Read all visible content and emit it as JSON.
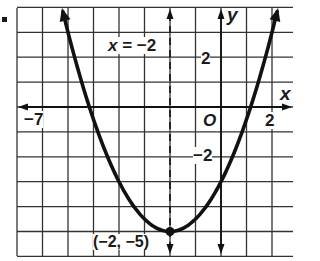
{
  "chart_data": {
    "type": "line",
    "title": "",
    "function": "y = 0.5(x + 2)^2 - 5",
    "xlabel": "x",
    "ylabel": "y",
    "xlim": [
      -8,
      2.8
    ],
    "ylim": [
      -5.8,
      4
    ],
    "grid": true,
    "grid_step": 1,
    "x_tick_labels": [
      {
        "value": -7,
        "label": "−7"
      },
      {
        "value": 2,
        "label": "2"
      }
    ],
    "y_tick_labels": [
      {
        "value": 2,
        "label": "2"
      },
      {
        "value": -2,
        "label": "−2"
      }
    ],
    "origin_label": "O",
    "axis_of_symmetry": {
      "x": -2,
      "label": "x = −2",
      "style": "dashed"
    },
    "vertex": {
      "x": -2,
      "y": -5,
      "label": "(−2, −5)"
    },
    "curve_points": [
      {
        "x": -6.2,
        "y": 3.82
      },
      {
        "x": -5.16,
        "y": 0
      },
      {
        "x": -4,
        "y": -3
      },
      {
        "x": -2,
        "y": -5
      },
      {
        "x": 0,
        "y": -3
      },
      {
        "x": 1.16,
        "y": 0
      },
      {
        "x": 2.2,
        "y": 3.82
      }
    ],
    "colors": {
      "curve": "#111111",
      "grid": "#333333",
      "axis": "#111111"
    }
  },
  "labels": {
    "x_axis": "x",
    "y_axis": "y",
    "origin": "O",
    "tick_x_neg7": "−7",
    "tick_x_2": "2",
    "tick_y_2": "2",
    "tick_y_neg2": "−2",
    "symmetry_eq_x": "x",
    "symmetry_eq_rest": " = −2",
    "vertex": "(−2, −5)"
  }
}
